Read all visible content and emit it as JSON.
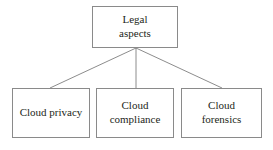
{
  "diagram": {
    "type": "tree",
    "background_color": "#ffffff",
    "border_color": "#8a8a8a",
    "text_color": "#231f20",
    "line_color": "#6e6e6e",
    "root": {
      "id": "legal-aspects",
      "label": "Legal\naspects"
    },
    "children": [
      {
        "id": "cloud-privacy",
        "label": "Cloud privacy"
      },
      {
        "id": "cloud-compliance",
        "label": "Cloud\ncompliance"
      },
      {
        "id": "cloud-forensics",
        "label": "Cloud\nforensics"
      }
    ],
    "edges": [
      {
        "from": "legal-aspects",
        "to": "cloud-privacy"
      },
      {
        "from": "legal-aspects",
        "to": "cloud-compliance"
      },
      {
        "from": "legal-aspects",
        "to": "cloud-forensics"
      }
    ]
  }
}
